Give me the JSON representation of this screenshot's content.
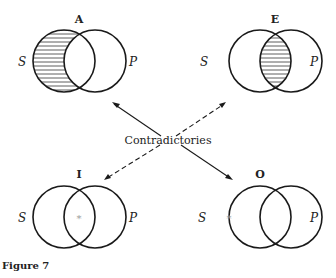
{
  "diagrams": [
    {
      "id": "A",
      "title": "A",
      "left_label": "S",
      "right_label": "P",
      "shading": "S-minus-P",
      "mark": ""
    },
    {
      "id": "E",
      "title": "E",
      "left_label": "S",
      "right_label": "P",
      "shading": "S-and-P",
      "mark": ""
    },
    {
      "id": "I",
      "title": "I",
      "left_label": "S",
      "right_label": "P",
      "shading": "none",
      "mark": "*"
    },
    {
      "id": "O",
      "title": "O",
      "left_label": "S",
      "right_label": "P",
      "shading": "none",
      "mark": "*"
    }
  ],
  "center_label": "Contradictories",
  "caption": "Figure 7",
  "colors": {
    "stroke": "#1a1a1a",
    "hatch": "#333333",
    "mark": "#999999"
  }
}
